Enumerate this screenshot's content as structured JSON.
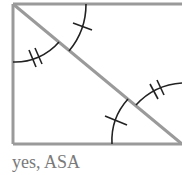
{
  "figure": {
    "type": "rectangle-with-diagonal",
    "caption": "yes, ASA",
    "colors": {
      "outline": "#9a9a9a",
      "marks": "#222222",
      "caption": "#7a7a7a"
    },
    "angle_marks": [
      {
        "corner": "top-left, upper triangle",
        "ticks": 1
      },
      {
        "corner": "top-left, lower triangle",
        "ticks": 2
      },
      {
        "corner": "bottom-right, lower triangle",
        "ticks": 1
      },
      {
        "corner": "bottom-right, upper triangle",
        "ticks": 2
      }
    ]
  }
}
